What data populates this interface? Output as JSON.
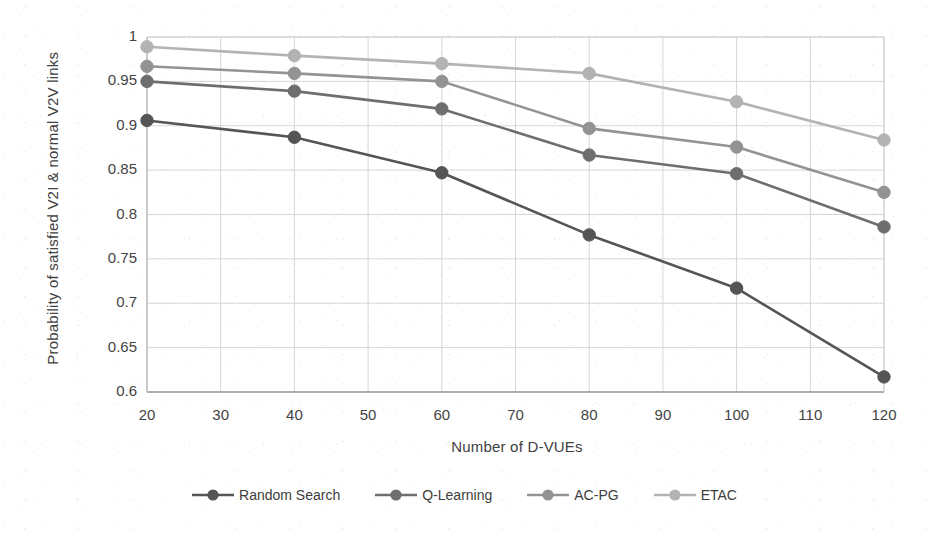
{
  "chart_data": {
    "type": "line",
    "title": "",
    "xlabel": "Number of D-VUEs",
    "ylabel": "Probability of satisfied V2I & normal V2V links",
    "x": [
      20,
      40,
      60,
      80,
      100,
      120
    ],
    "xlim": [
      20,
      120
    ],
    "ylim": [
      0.6,
      1.0
    ],
    "xticks": [
      20,
      30,
      40,
      50,
      60,
      70,
      80,
      90,
      100,
      110,
      120
    ],
    "yticks": [
      1,
      0.95,
      0.9,
      0.85,
      0.8,
      0.75,
      0.7,
      0.65,
      0.6
    ],
    "ytick_labels": [
      "1",
      "0.95",
      "0.9",
      "0.85",
      "0.8",
      "0.75",
      "0.7",
      "0.65",
      "0.6"
    ],
    "xtick_labels": [
      "20",
      "30",
      "40",
      "50",
      "60",
      "70",
      "80",
      "90",
      "100",
      "110",
      "120"
    ],
    "grid": true,
    "legend_position": "bottom",
    "series": [
      {
        "name": "Random Search",
        "color": "#555555",
        "values": [
          0.906,
          0.887,
          0.847,
          0.777,
          0.717,
          0.617
        ]
      },
      {
        "name": "Q-Learning",
        "color": "#6e6e6e",
        "values": [
          0.95,
          0.939,
          0.919,
          0.867,
          0.846,
          0.786
        ]
      },
      {
        "name": "AC-PG",
        "color": "#939393",
        "values": [
          0.967,
          0.959,
          0.95,
          0.897,
          0.876,
          0.825
        ]
      },
      {
        "name": "ETAC",
        "color": "#b3b3b3",
        "values": [
          0.989,
          0.979,
          0.97,
          0.959,
          0.927,
          0.884
        ]
      }
    ]
  },
  "legend": {
    "items": [
      {
        "label": "Random Search",
        "color": "#555555"
      },
      {
        "label": "Q-Learning",
        "color": "#6e6e6e"
      },
      {
        "label": "AC-PG",
        "color": "#939393"
      },
      {
        "label": "ETAC",
        "color": "#b3b3b3"
      }
    ]
  },
  "axes": {
    "y_title": "Probability of satisfied V2I & normal V2V links",
    "x_title": "Number of D-VUEs"
  }
}
